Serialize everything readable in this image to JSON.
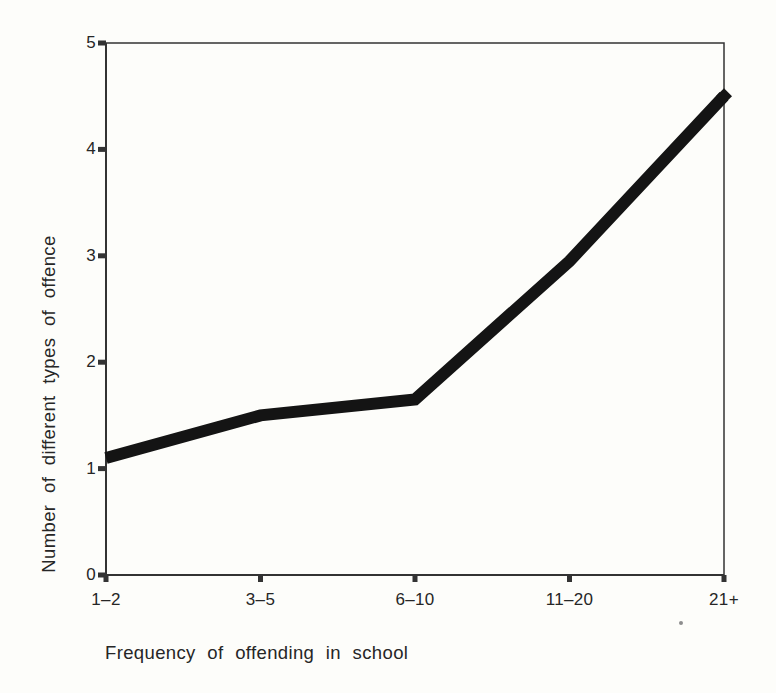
{
  "figure": {
    "background_color": "#fdfdfa"
  },
  "chart_data": {
    "type": "line",
    "title": "",
    "categories": [
      "1–2",
      "3–5",
      "6–10",
      "11–20",
      "21+"
    ],
    "values": [
      1.1,
      1.5,
      1.65,
      2.95,
      4.5
    ],
    "xlabel": "Frequency of offending in school",
    "ylabel": "Number of different types of offence",
    "ylim": [
      0,
      5
    ],
    "yticks": [
      0,
      1,
      2,
      3,
      4,
      5
    ],
    "grid": false,
    "legend": false,
    "frame": "full-box",
    "line_color": "#141414",
    "axis_color": "#333333",
    "text_color": "#262626",
    "line_width_px": 12
  }
}
